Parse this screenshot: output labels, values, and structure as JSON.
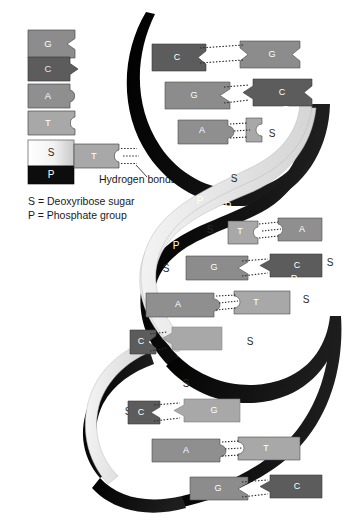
{
  "diagram": {
    "background_color": "#ffffff"
  },
  "legend": {
    "bases": [
      {
        "label": "G",
        "name": "guanine",
        "color": "#8c8c8c",
        "edge": "notch-v",
        "text_color": "#ffffff"
      },
      {
        "label": "C",
        "name": "cytosine",
        "color": "#5c5c5c",
        "edge": "point-v",
        "text_color": "#e6e6e6"
      },
      {
        "label": "A",
        "name": "adenine",
        "color": "#8f8f8f",
        "edge": "bump-round",
        "text_color": "#ffffff"
      },
      {
        "label": "T",
        "name": "thymine",
        "color": "#a8a8a8",
        "edge": "notch-round",
        "text_color": "#ffffff"
      }
    ],
    "backbone_sample": {
      "sugar_label": "S",
      "sugar_color": "#e9e9e9",
      "phosphate_label": "P",
      "phosphate_color": "#0d0d0d",
      "attached_base_label": "T",
      "attached_base_color": "#a8a8a8"
    },
    "hydrogen_bonds_label": "Hydrogen bonds",
    "keys": [
      "S = Deoxyribose sugar",
      "P = Phosphate group"
    ]
  },
  "helix": {
    "strand_left_name": "backbone-strand-left",
    "strand_right_name": "backbone-strand-right",
    "ribbon_dark_color": "#121212",
    "ribbon_light_color": "#ededed",
    "sugar_label": "S",
    "phosphate_label": "P",
    "base_pairs": [
      {
        "left": "C",
        "right": "G",
        "bonds": 3,
        "y": 58
      },
      {
        "left": "G",
        "right": "C",
        "bonds": 3,
        "y": 95
      },
      {
        "left": "A",
        "right": "T",
        "bonds": 2,
        "y": 131
      },
      {
        "left": "T",
        "right": "A",
        "bonds": 2,
        "y": 232
      },
      {
        "left": "G",
        "right": "C",
        "bonds": 3,
        "y": 268
      },
      {
        "left": "A",
        "right": "T",
        "bonds": 2,
        "y": 305
      },
      {
        "left": "C",
        "right": "G",
        "bonds": 3,
        "y": 342
      },
      {
        "left": "C",
        "right": "G",
        "bonds": 3,
        "y": 412
      },
      {
        "left": "A",
        "right": "T",
        "bonds": 2,
        "y": 450
      },
      {
        "left": "G",
        "right": "C",
        "bonds": 3,
        "y": 488
      }
    ],
    "backbone_units": [
      {
        "label": "P",
        "y": 118
      },
      {
        "label": "S",
        "y": 135
      },
      {
        "label": "P",
        "y": 155
      },
      {
        "label": "S",
        "y": 176
      },
      {
        "label": "P",
        "y": 197
      },
      {
        "label": "S",
        "y": 232
      },
      {
        "label": "P",
        "y": 248
      },
      {
        "label": "S",
        "y": 268
      },
      {
        "label": "P",
        "y": 289
      },
      {
        "label": "S",
        "y": 310
      },
      {
        "label": "P",
        "y": 330
      },
      {
        "label": "S",
        "y": 350
      },
      {
        "label": "P",
        "y": 372
      },
      {
        "label": "S",
        "y": 393
      },
      {
        "label": "P",
        "y": 412
      }
    ]
  },
  "colors": {
    "base_G": "#8c8c8c",
    "base_C": "#5c5c5c",
    "base_A": "#8f8f8f",
    "base_T": "#a8a8a8",
    "sugar": "#e9e9e9",
    "phosphate": "#111111",
    "ribbon_dark": "#141414",
    "ribbon_light": "#ececec",
    "text_dark": "#1a1a1a",
    "bond_dots": "#2a2a2a"
  }
}
